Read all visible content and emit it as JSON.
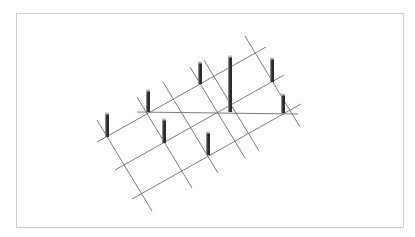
{
  "diagram": {
    "colors": {
      "background": "#ffffff",
      "frame": "#cfcfcf",
      "grid_line": "#6e6e6e",
      "column_body": "#2b2b2b",
      "column_side": "#8a8a8a",
      "column_cap": "#bdbdbd"
    },
    "rising_lines": [
      {
        "x1": 97,
        "y1": 142,
        "x2": 266,
        "y2": 47
      },
      {
        "x1": 115,
        "y1": 170,
        "x2": 284,
        "y2": 75
      },
      {
        "x1": 132,
        "y1": 199,
        "x2": 301,
        "y2": 104
      }
    ],
    "horizontal_lines": [
      {
        "x1": 137,
        "y1": 112,
        "x2": 298,
        "y2": 114
      }
    ],
    "falling_lines": [
      {
        "x1": 97,
        "y1": 120,
        "x2": 152,
        "y2": 211
      },
      {
        "x1": 137,
        "y1": 97,
        "x2": 192,
        "y2": 188
      },
      {
        "x1": 163,
        "y1": 82,
        "x2": 218,
        "y2": 173
      },
      {
        "x1": 190,
        "y1": 67,
        "x2": 245,
        "y2": 158
      },
      {
        "x1": 204,
        "y1": 60,
        "x2": 259,
        "y2": 151
      },
      {
        "x1": 245,
        "y1": 36,
        "x2": 300,
        "y2": 127
      }
    ],
    "columns": [
      {
        "x": 107,
        "top": 113,
        "bottom": 137
      },
      {
        "x": 148,
        "top": 90,
        "bottom": 112
      },
      {
        "x": 164,
        "top": 119,
        "bottom": 143
      },
      {
        "x": 200,
        "top": 62,
        "bottom": 84
      },
      {
        "x": 208,
        "top": 132,
        "bottom": 155
      },
      {
        "x": 230,
        "top": 56,
        "bottom": 112
      },
      {
        "x": 272,
        "top": 58,
        "bottom": 82
      },
      {
        "x": 283,
        "top": 94,
        "bottom": 113
      }
    ]
  }
}
